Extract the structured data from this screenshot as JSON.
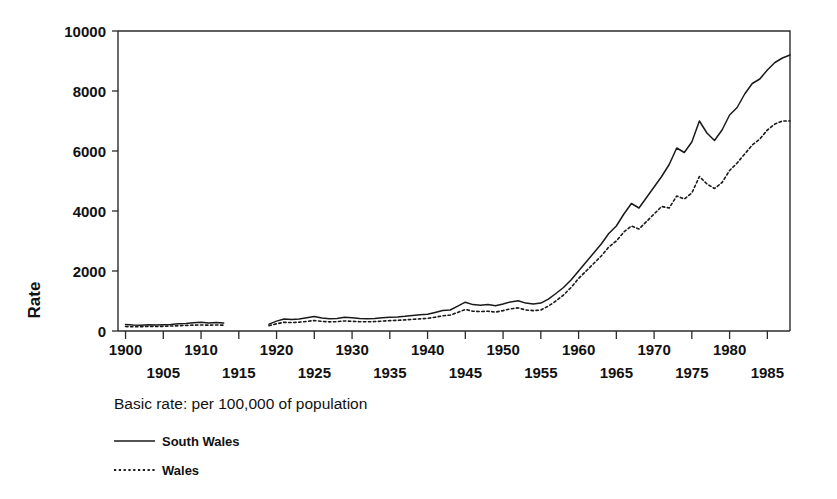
{
  "chart_data": {
    "type": "line",
    "title": "",
    "subtitle": "",
    "caption": "Basic rate: per 100,000 of population",
    "xlabel": "",
    "ylabel": "Rate",
    "ylim": [
      0,
      10000
    ],
    "xlim": [
      1899,
      1988
    ],
    "grid": false,
    "legend_position": "below-left",
    "y_ticks": [
      0,
      2000,
      4000,
      6000,
      8000,
      10000
    ],
    "y_tick_labels": [
      "0",
      "2000",
      "4000",
      "6000",
      "8000",
      "10000"
    ],
    "x_ticks_major": [
      1900,
      1910,
      1920,
      1930,
      1940,
      1950,
      1960,
      1970,
      1980
    ],
    "x_tick_labels_upper": [
      "1900",
      "1910",
      "1920",
      "1930",
      "1940",
      "1950",
      "1960",
      "1970",
      "1980"
    ],
    "x_ticks_minor": [
      1905,
      1915,
      1925,
      1935,
      1945,
      1955,
      1965,
      1975,
      1985
    ],
    "x_tick_labels_lower": [
      "1905",
      "1915",
      "1925",
      "1935",
      "1945",
      "1955",
      "1965",
      "1975",
      "1985"
    ],
    "x_tick_all": [
      1900,
      1905,
      1910,
      1915,
      1920,
      1925,
      1930,
      1935,
      1940,
      1945,
      1950,
      1955,
      1960,
      1965,
      1970,
      1975,
      1980,
      1985
    ],
    "data_gap_years": [
      1914,
      1915,
      1916,
      1917,
      1918
    ],
    "series": [
      {
        "name": "South Wales",
        "style": "solid",
        "color": "#1a1a1a",
        "x": [
          1900,
          1901,
          1902,
          1903,
          1904,
          1905,
          1906,
          1907,
          1908,
          1909,
          1910,
          1911,
          1912,
          1913,
          1919,
          1920,
          1921,
          1922,
          1923,
          1924,
          1925,
          1926,
          1927,
          1928,
          1929,
          1930,
          1931,
          1932,
          1933,
          1934,
          1935,
          1936,
          1937,
          1938,
          1939,
          1940,
          1941,
          1942,
          1943,
          1944,
          1945,
          1946,
          1947,
          1948,
          1949,
          1950,
          1951,
          1952,
          1953,
          1954,
          1955,
          1956,
          1957,
          1958,
          1959,
          1960,
          1961,
          1962,
          1963,
          1964,
          1965,
          1966,
          1967,
          1968,
          1969,
          1970,
          1971,
          1972,
          1973,
          1974,
          1975,
          1976,
          1977,
          1978,
          1979,
          1980,
          1981,
          1982,
          1983,
          1984,
          1985,
          1986,
          1987,
          1988
        ],
        "values": [
          220,
          200,
          195,
          205,
          200,
          210,
          220,
          240,
          250,
          275,
          290,
          265,
          285,
          270,
          230,
          330,
          400,
          380,
          400,
          440,
          480,
          430,
          410,
          420,
          460,
          440,
          420,
          410,
          420,
          440,
          460,
          470,
          490,
          520,
          540,
          560,
          620,
          680,
          700,
          830,
          960,
          880,
          860,
          880,
          840,
          900,
          970,
          1010,
          930,
          900,
          930,
          1060,
          1250,
          1450,
          1700,
          2000,
          2300,
          2600,
          2900,
          3250,
          3500,
          3900,
          4250,
          4100,
          4450,
          4800,
          5150,
          5550,
          6100,
          5950,
          6300,
          7000,
          6600,
          6350,
          6700,
          7200,
          7450,
          7900,
          8250,
          8400,
          8700,
          8950,
          9100,
          9200
        ]
      },
      {
        "name": "Wales",
        "style": "dotted",
        "color": "#1a1a1a",
        "x": [
          1900,
          1901,
          1902,
          1903,
          1904,
          1905,
          1906,
          1907,
          1908,
          1909,
          1910,
          1911,
          1912,
          1913,
          1919,
          1920,
          1921,
          1922,
          1923,
          1924,
          1925,
          1926,
          1927,
          1928,
          1929,
          1930,
          1931,
          1932,
          1933,
          1934,
          1935,
          1936,
          1937,
          1938,
          1939,
          1940,
          1941,
          1942,
          1943,
          1944,
          1945,
          1946,
          1947,
          1948,
          1949,
          1950,
          1951,
          1952,
          1953,
          1954,
          1955,
          1956,
          1957,
          1958,
          1959,
          1960,
          1961,
          1962,
          1963,
          1964,
          1965,
          1966,
          1967,
          1968,
          1969,
          1970,
          1971,
          1972,
          1973,
          1974,
          1975,
          1976,
          1977,
          1978,
          1979,
          1980,
          1981,
          1982,
          1983,
          1984,
          1985,
          1986,
          1987,
          1988
        ],
        "values": [
          150,
          140,
          145,
          150,
          150,
          155,
          165,
          175,
          185,
          195,
          200,
          195,
          200,
          195,
          180,
          240,
          290,
          280,
          295,
          320,
          350,
          320,
          305,
          310,
          335,
          325,
          310,
          305,
          315,
          330,
          345,
          355,
          370,
          390,
          405,
          420,
          460,
          505,
          530,
          620,
          720,
          660,
          650,
          660,
          630,
          680,
          740,
          770,
          700,
          680,
          700,
          830,
          1000,
          1200,
          1450,
          1750,
          2000,
          2250,
          2500,
          2800,
          3000,
          3300,
          3500,
          3400,
          3650,
          3900,
          4150,
          4100,
          4500,
          4400,
          4600,
          5150,
          4900,
          4750,
          4950,
          5350,
          5600,
          5900,
          6200,
          6400,
          6700,
          6900,
          7000,
          7000
        ]
      }
    ]
  },
  "legend": {
    "caption": "Basic rate: per 100,000 of population",
    "entries": [
      {
        "label": "South Wales",
        "style": "solid"
      },
      {
        "label": "Wales",
        "style": "dotted"
      }
    ]
  },
  "axes": {
    "y_title": "Rate"
  }
}
